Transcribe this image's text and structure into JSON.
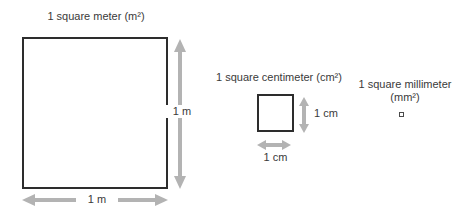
{
  "diagram": {
    "meter": {
      "title": "1 square meter (m²)",
      "height_label": "1 m",
      "width_label": "1 m"
    },
    "centimeter": {
      "title": "1 square centimeter (cm²)",
      "height_label": "1 cm",
      "width_label": "1 cm"
    },
    "millimeter": {
      "title": "1 square millimeter (mm²)"
    },
    "colors": {
      "background": "#ffffff",
      "arrow": "#b3b3b3",
      "outline": "#2d2d2d",
      "text": "#3a3a3a"
    }
  }
}
